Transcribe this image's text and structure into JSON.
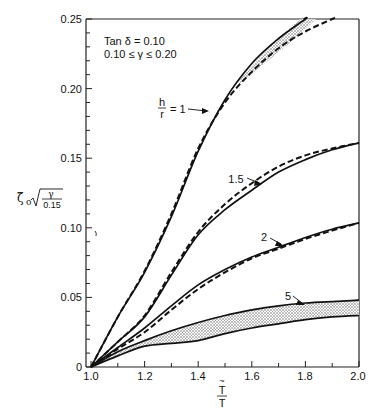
{
  "chart_data": {
    "type": "line",
    "title": "",
    "xlabel": "T̃ / T",
    "ylabel": "ζ̃₀ √(γ / 0.15)",
    "xlim": [
      1.0,
      2.0
    ],
    "ylim": [
      0,
      0.25
    ],
    "grid": false,
    "legend": "none (curves labelled inline)",
    "x_ticks": [
      "1.0",
      "1.2",
      "1.4",
      "1.6",
      "1.8",
      "2.0"
    ],
    "y_ticks": [
      "0",
      "0.05",
      "0.10",
      "0.15",
      "0.20",
      "0.25"
    ],
    "annotations": {
      "conditions_line1": "Tan δ = 0.10",
      "conditions_line2": "0.10 ≤ γ ≤ 0.20",
      "curve_labels": [
        "h/r = 1",
        "1.5",
        "2",
        "5"
      ]
    },
    "x": [
      1.0,
      1.1,
      1.2,
      1.3,
      1.4,
      1.5,
      1.6,
      1.7,
      1.8,
      1.9,
      2.0
    ],
    "series": [
      {
        "name": "h/r = 1 (solid)",
        "style": "solid",
        "values": [
          0,
          0.036,
          0.068,
          0.108,
          0.155,
          0.192,
          0.218,
          0.236,
          0.251,
          null,
          null
        ]
      },
      {
        "name": "h/r = 1 (dashed)",
        "style": "dashed",
        "values": [
          0,
          0.036,
          0.069,
          0.11,
          0.157,
          0.19,
          0.212,
          0.229,
          0.241,
          0.25,
          null
        ]
      },
      {
        "name": "h/r = 1.5 (solid)",
        "style": "solid",
        "values": [
          0,
          0.018,
          0.036,
          0.066,
          0.095,
          0.113,
          0.127,
          0.14,
          0.149,
          0.156,
          0.161
        ]
      },
      {
        "name": "h/r = 1.5 (dashed)",
        "style": "dashed",
        "values": [
          0,
          0.018,
          0.037,
          0.068,
          0.097,
          0.117,
          0.132,
          0.144,
          0.152,
          0.157,
          0.161
        ]
      },
      {
        "name": "h/r = 2 (solid)",
        "style": "solid",
        "values": [
          0,
          0.014,
          0.028,
          0.044,
          0.059,
          0.07,
          0.079,
          0.086,
          0.093,
          0.099,
          0.1035
        ]
      },
      {
        "name": "h/r = 2 (dashed)",
        "style": "dashed",
        "values": [
          0,
          0.013,
          0.025,
          0.041,
          0.056,
          0.068,
          0.078,
          0.085,
          0.092,
          0.098,
          0.1035
        ]
      },
      {
        "name": "h/r = 5 (upper bound)",
        "style": "solid",
        "values": [
          0,
          0.011,
          0.019,
          0.026,
          0.032,
          0.037,
          0.041,
          0.044,
          0.046,
          0.047,
          0.048
        ]
      },
      {
        "name": "h/r = 5 (lower bound)",
        "style": "solid",
        "values": [
          0,
          0.008,
          0.015,
          0.017,
          0.019,
          0.024,
          0.028,
          0.031,
          0.034,
          0.036,
          0.037
        ]
      }
    ],
    "shaded_bands": [
      {
        "between": [
          "h/r = 1 (solid)",
          "h/r = 1 (dashed)"
        ],
        "from_x": 1.55,
        "fill": "stipple"
      },
      {
        "between": [
          "h/r = 5 (upper bound)",
          "h/r = 5 (lower bound)"
        ],
        "from_x": 1.0,
        "fill": "stipple"
      }
    ],
    "colors": {
      "ink": "#111111",
      "background": "#ffffff",
      "stipple": "#bdbdbd"
    }
  }
}
